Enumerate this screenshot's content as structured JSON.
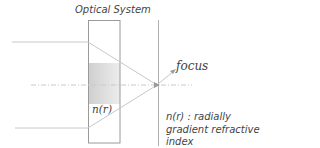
{
  "diagram": {
    "title": "Optical System",
    "focus_label": "focus",
    "element_label": "n(r)",
    "description": "n(r) : radially gradient refractive index"
  },
  "colors": {
    "line": "#c8c8c8",
    "box": "#9a9a9a",
    "shade_dark": "#d0d0d0",
    "shade_light": "#ececec",
    "text": "#444444"
  }
}
